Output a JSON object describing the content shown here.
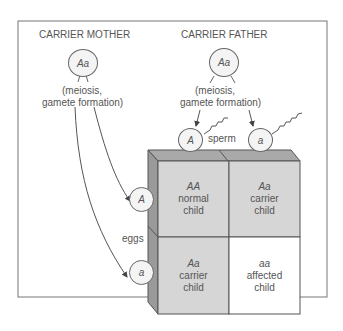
{
  "mother": {
    "title": "CARRIER MOTHER",
    "genotype": "Aa",
    "process": [
      "(meiosis,",
      "gamete formation)"
    ]
  },
  "father": {
    "title": "CARRIER FATHER",
    "genotype": "Aa",
    "process": [
      "(meiosis,",
      "gamete formation)"
    ]
  },
  "sperm": {
    "label": "sperm",
    "alleles": [
      "A",
      "a"
    ]
  },
  "eggs": {
    "label": "eggs",
    "alleles": [
      "A",
      "a"
    ]
  },
  "grid": [
    {
      "genotype": "AA",
      "line1": "normal",
      "line2": "child"
    },
    {
      "genotype": "Aa",
      "line1": "carrier",
      "line2": "child"
    },
    {
      "genotype": "Aa",
      "line1": "carrier",
      "line2": "child"
    },
    {
      "genotype": "aa",
      "line1": "affected",
      "line2": "child"
    }
  ],
  "colors": {
    "shaded": "#d6d6d6",
    "top": "#a9a9a9",
    "side": "#9a9a9a",
    "unshaded": "#ffffff"
  }
}
